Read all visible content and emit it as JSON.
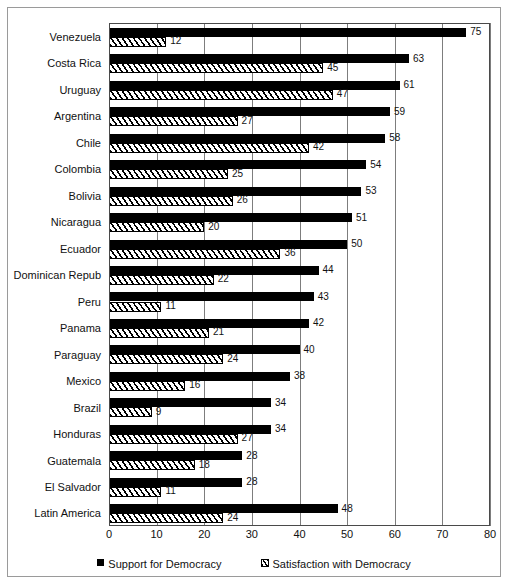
{
  "chart_data": {
    "type": "bar",
    "orientation": "horizontal",
    "title": "",
    "subtitle": "",
    "xlabel": "",
    "ylabel": "",
    "xlim": [
      0,
      80
    ],
    "xticks": [
      0,
      10,
      20,
      30,
      40,
      50,
      60,
      70,
      80
    ],
    "grid": true,
    "grid_axis": "x",
    "legend_position": "bottom",
    "categories": [
      "Venezuela",
      "Costa Rica",
      "Uruguay",
      "Argentina",
      "Chile",
      "Colombia",
      "Bolivia",
      "Nicaragua",
      "Ecuador",
      "Dominican Repub",
      "Peru",
      "Panama",
      "Paraguay",
      "Mexico",
      "Brazil",
      "Honduras",
      "Guatemala",
      "El Salvador",
      "Latin America"
    ],
    "series": [
      {
        "name": "Support for Democracy",
        "marker": "solid-black-square",
        "color": "#000000",
        "values": [
          75,
          63,
          61,
          59,
          58,
          54,
          53,
          51,
          50,
          44,
          43,
          42,
          40,
          38,
          34,
          34,
          28,
          28,
          48
        ]
      },
      {
        "name": "Satisfaction with Democracy",
        "marker": "diagonal-hatch",
        "color": "#ffffff",
        "values": [
          12,
          45,
          47,
          27,
          42,
          25,
          26,
          20,
          36,
          22,
          11,
          21,
          24,
          16,
          9,
          27,
          18,
          11,
          24
        ]
      }
    ]
  },
  "axis": {
    "tick_labels": [
      "0",
      "10",
      "20",
      "30",
      "40",
      "50",
      "60",
      "70",
      "80"
    ]
  },
  "legend": {
    "items": [
      {
        "label": "Support for Democracy",
        "marker": "solid-black-square"
      },
      {
        "label": "Satisfaction with Democracy",
        "marker": "diagonal-hatch"
      }
    ]
  }
}
